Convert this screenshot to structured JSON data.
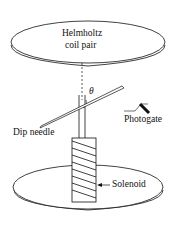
{
  "diagram": {
    "labels": {
      "coil_line1": "Helmholtz",
      "coil_line2": "coil pair",
      "theta": "θ",
      "photogate": "Photogate",
      "dip_needle": "Dip needle",
      "solenoid": "Solenoid"
    }
  }
}
